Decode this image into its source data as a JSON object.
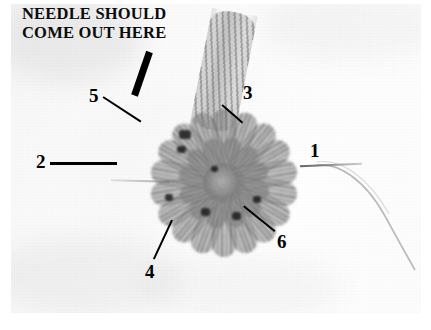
{
  "figure": {
    "type": "instructional-photo",
    "caption": "NEEDLE SHOULD\nCOME OUT HERE",
    "caption_line_1": "NEEDLE SHOULD",
    "caption_line_2": "COME OUT HERE",
    "colors": {
      "ink": "#000000",
      "photo_background": "#f7f7f7",
      "yarn": "#8a8a8a",
      "plate_border": "#ffffff"
    }
  },
  "callouts": [
    {
      "id": "1",
      "label": "1",
      "position": "right",
      "points_to": "needle-shaft-right"
    },
    {
      "id": "2",
      "label": "2",
      "position": "left",
      "points_to": "needle-tip-left"
    },
    {
      "id": "3",
      "label": "3",
      "points_to": "yarn-chain-cord",
      "position": "upper-right"
    },
    {
      "id": "4",
      "label": "4",
      "points_to": "outer-petal-bottom",
      "position": "lower-left"
    },
    {
      "id": "5",
      "label": "5",
      "points_to": "upper-left-petal",
      "position": "upper-left"
    },
    {
      "id": "6",
      "label": "6",
      "points_to": "outer-petal-right",
      "position": "lower-right"
    }
  ],
  "pointer": {
    "name": "needle-exit-pointer",
    "shape": "thick-diagonal-bar"
  }
}
